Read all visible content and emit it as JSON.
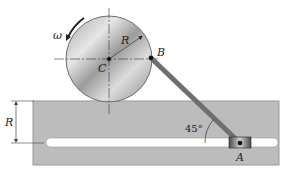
{
  "diagram": {
    "labels": {
      "omega": "ω",
      "radius_disk": "R",
      "center": "C",
      "point_b": "B",
      "point_a": "A",
      "radius_offset": "R",
      "angle": "45°"
    },
    "colors": {
      "plate": "#b9b9b9",
      "plate_edge": "#8a8a8a",
      "slot": "#ffffff",
      "disk_light": "#f2f2f2",
      "disk_dark": "#8f8f8f",
      "rod": "#707070",
      "slider": "#5a5a5a",
      "text": "#222222"
    }
  }
}
